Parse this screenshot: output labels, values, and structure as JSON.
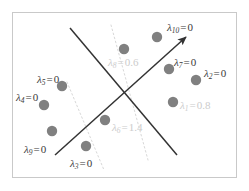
{
  "figure": {
    "kind": "svm-margin-diagram",
    "background_color": "#ffffff",
    "frame_color": "#c9c9c9",
    "point_color": "#808080",
    "line_color": "#333333",
    "margin_line_color": "#d8d8d8",
    "faint_text_color": "#cccccc",
    "dark_text_color": "#3a3a3a"
  },
  "chart_data": {
    "type": "scatter",
    "title": "",
    "xlabel": "",
    "ylabel": "",
    "grid": false,
    "legend": false,
    "lambda_symbol": "λ",
    "points": [
      {
        "id": "p10",
        "symbol": "λ",
        "subscript": "10",
        "equals": "=",
        "value": "0",
        "x": 157,
        "y": 37,
        "label_x": 167,
        "label_y": 22,
        "faint": false
      },
      {
        "id": "p8",
        "symbol": "λ",
        "subscript": "8",
        "equals": "=",
        "value": "0.6",
        "x": 124,
        "y": 49,
        "label_x": 108,
        "label_y": 57,
        "faint": true
      },
      {
        "id": "p7",
        "symbol": "λ",
        "subscript": "7",
        "equals": "=",
        "value": "0",
        "x": 169,
        "y": 69,
        "label_x": 174,
        "label_y": 57,
        "faint": false
      },
      {
        "id": "p2",
        "symbol": "λ",
        "subscript": "2",
        "equals": "=",
        "value": "0",
        "x": 196,
        "y": 80,
        "label_x": 204,
        "label_y": 68,
        "faint": false
      },
      {
        "id": "p1",
        "symbol": "λ",
        "subscript": "1",
        "equals": "=",
        "value": "0.8",
        "x": 173,
        "y": 102,
        "label_x": 180,
        "label_y": 100,
        "faint": true
      },
      {
        "id": "p5",
        "symbol": "λ",
        "subscript": "5",
        "equals": "=",
        "value": "0",
        "x": 62,
        "y": 86,
        "label_x": 37,
        "label_y": 74,
        "faint": false
      },
      {
        "id": "p4",
        "symbol": "λ",
        "subscript": "4",
        "equals": "=",
        "value": "0",
        "x": 44,
        "y": 105,
        "label_x": 16,
        "label_y": 92,
        "faint": false
      },
      {
        "id": "p9",
        "symbol": "λ",
        "subscript": "9",
        "equals": "=",
        "value": "0",
        "x": 52,
        "y": 131,
        "label_x": 24,
        "label_y": 144,
        "faint": false
      },
      {
        "id": "p6",
        "symbol": "λ",
        "subscript": "6",
        "equals": "=",
        "value": "1.4",
        "x": 105,
        "y": 120,
        "label_x": 112,
        "label_y": 122,
        "faint": true
      },
      {
        "id": "p3",
        "symbol": "λ",
        "subscript": "3",
        "equals": "=",
        "value": "0",
        "x": 86,
        "y": 146,
        "label_x": 70,
        "label_y": 158,
        "faint": false
      }
    ],
    "point_radius": 5.2,
    "lines": [
      {
        "id": "decision-boundary-descending",
        "style": "solid",
        "arrow": false,
        "x1": 70,
        "y1": 28,
        "x2": 177,
        "y2": 155
      },
      {
        "id": "axis-ascending-arrow",
        "style": "solid",
        "arrow": true,
        "x1": 55,
        "y1": 155,
        "x2": 186,
        "y2": 37
      },
      {
        "id": "margin-upper-dotted",
        "style": "dotted",
        "arrow": false,
        "x1": 111,
        "y1": 25,
        "x2": 148,
        "y2": 160
      },
      {
        "id": "margin-lower-dotted",
        "style": "dotted",
        "arrow": false,
        "x1": 67,
        "y1": 82,
        "x2": 104,
        "y2": 170
      }
    ]
  }
}
